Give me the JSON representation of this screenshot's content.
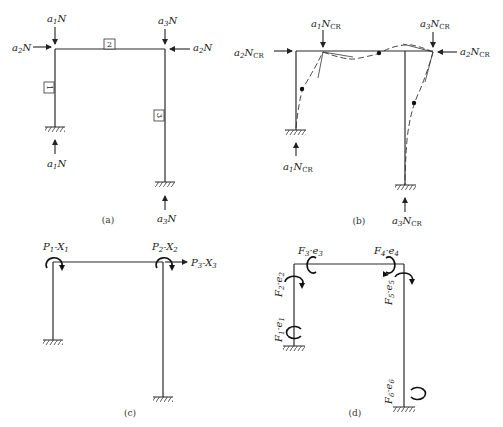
{
  "figure": {
    "panels": [
      {
        "id": "a",
        "caption": "(a)",
        "loads": {
          "top_left": {
            "coef": "a",
            "sub": "1",
            "sym": "N"
          },
          "left_horizontal": {
            "coef": "a",
            "sub": "2",
            "sym": "N"
          },
          "top_right": {
            "coef": "a",
            "sub": "3",
            "sym": "N"
          },
          "right_horizontal": {
            "coef": "a",
            "sub": "2",
            "sym": "N"
          },
          "bottom_left": {
            "coef": "a",
            "sub": "1",
            "sym": "N"
          },
          "bottom_right": {
            "coef": "a",
            "sub": "3",
            "sym": "N"
          }
        },
        "member_labels": [
          "1",
          "2",
          "3"
        ]
      },
      {
        "id": "b",
        "caption": "(b)",
        "loads": {
          "top_left": {
            "coef": "a",
            "sub": "1",
            "sym": "N",
            "suffix": "CR"
          },
          "left_horizontal": {
            "coef": "a",
            "sub": "2",
            "sym": "N",
            "suffix": "CR"
          },
          "top_right": {
            "coef": "a",
            "sub": "3",
            "sym": "N",
            "suffix": "CR"
          },
          "right_horizontal": {
            "coef": "a",
            "sub": "2",
            "sym": "N",
            "suffix": "CR"
          },
          "bottom_left": {
            "coef": "a",
            "sub": "1",
            "sym": "N",
            "suffix": "CR"
          },
          "bottom_right": {
            "coef": "a",
            "sub": "3",
            "sym": "N",
            "suffix": "CR"
          }
        },
        "note": "buckled shape (dashed) with inflection points"
      },
      {
        "id": "c",
        "caption": "(c)",
        "actions": [
          {
            "p": "P",
            "ps": "1",
            "x": "X",
            "xs": "1",
            "type": "moment"
          },
          {
            "p": "P",
            "ps": "2",
            "x": "X",
            "xs": "2",
            "type": "moment"
          },
          {
            "p": "P",
            "ps": "3",
            "x": "X",
            "xs": "3",
            "type": "force"
          }
        ]
      },
      {
        "id": "d",
        "caption": "(d)",
        "member_end_actions": [
          {
            "f": "F",
            "fs": "1",
            "e": "e",
            "es": "1"
          },
          {
            "f": "F",
            "fs": "2",
            "e": "e",
            "es": "2"
          },
          {
            "f": "F",
            "fs": "3",
            "e": "e",
            "es": "3"
          },
          {
            "f": "F",
            "fs": "4",
            "e": "e",
            "es": "4"
          },
          {
            "f": "F",
            "fs": "5",
            "e": "e",
            "es": "5"
          },
          {
            "f": "F",
            "fs": "6",
            "e": "e",
            "es": "6"
          }
        ]
      }
    ],
    "colors": {
      "line": "#2a2a2a",
      "background": "#ffffff"
    }
  }
}
